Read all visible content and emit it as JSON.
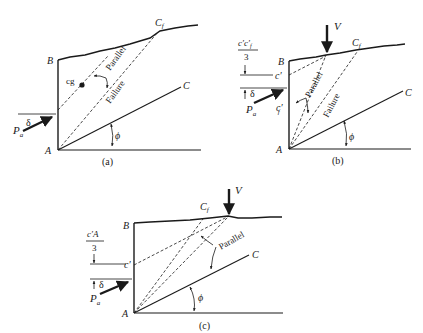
{
  "figure": {
    "panels": [
      {
        "id": "a",
        "caption": "(a)",
        "labels": {
          "B": "B",
          "A": "A",
          "C": "C",
          "Cf": "C",
          "Cf_sub": "f",
          "cg": "cg",
          "parallel": "Parallel",
          "failure": "Failure",
          "Pa": "P",
          "Pa_sub": "a",
          "delta": "δ",
          "phi": "ϕ"
        }
      },
      {
        "id": "b",
        "caption": "(b)",
        "labels": {
          "B": "B",
          "A": "A",
          "C": "C",
          "Cf": "C",
          "Cf_sub": "f",
          "V": "V",
          "frac_num": "c′c′",
          "frac_num_sub": "f",
          "frac_den": "3",
          "c_prime": "c′",
          "cf_prime": "c′",
          "cf_prime_sub": "f",
          "parallel": "Parallel",
          "failure": "Failure",
          "Pa": "P",
          "Pa_sub": "a",
          "delta": "δ",
          "phi": "ϕ"
        }
      },
      {
        "id": "c",
        "caption": "(c)",
        "labels": {
          "B": "B",
          "A": "A",
          "C": "C",
          "Cf": "C",
          "Cf_sub": "f",
          "V": "V",
          "frac_num": "c′A",
          "frac_den": "3",
          "c_prime": "c′",
          "parallel": "Parallel",
          "Pa": "P",
          "Pa_sub": "a",
          "delta": "δ",
          "phi": "ϕ"
        }
      }
    ]
  }
}
